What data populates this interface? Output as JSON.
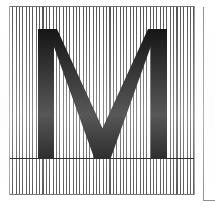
{
  "document": {
    "kind": "type-specimen-plate",
    "background_color": "#ffffff",
    "width": 215,
    "height": 208
  },
  "specimen": {
    "glyph": "M",
    "glyph_color": "#000000",
    "glyph_description": "uppercase-M",
    "panel": {
      "x": 9,
      "y": 6,
      "width": 186,
      "height": 189,
      "fill": "#ffffff",
      "border_color": "#6e6e6e"
    },
    "line_screen": {
      "orientation": "vertical",
      "stripe_color": "#2b2b2b",
      "gap_color": "#ffffff",
      "period_px": 3.35,
      "stripe_width_px": 1.05
    },
    "baseline": {
      "y": 158,
      "color": "#000000",
      "thickness_px": 1
    },
    "metrics": {
      "cap_top_y": 29,
      "baseline_y": 158,
      "left_edge_x": 38,
      "right_edge_x": 167,
      "stem_width_px": 16
    }
  },
  "side_panel": {
    "label": "",
    "x": 203,
    "y": 7,
    "border_color": "#8d8d8d",
    "fill": "#ffffff"
  }
}
